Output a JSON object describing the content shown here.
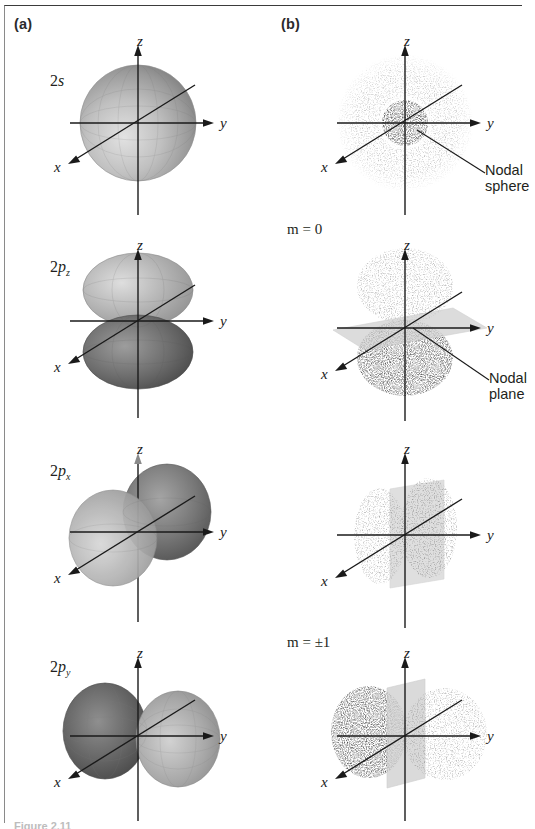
{
  "figure": {
    "columns": [
      {
        "key": "a",
        "letter": "(a)",
        "description": "boundary surface representations"
      },
      {
        "key": "b",
        "letter": "(b)",
        "description": "electron density dot cloud representations"
      }
    ],
    "caption_fragment": "Figure 2.11"
  },
  "axes": {
    "z": "z",
    "y": "y",
    "x": "x"
  },
  "rows": [
    {
      "orbital_prefix": "2",
      "orbital_symbol": "s",
      "orbital_subscript": "",
      "orbital_label_text": "2s",
      "m_label": "",
      "callout": ""
    },
    {
      "orbital_prefix": "2",
      "orbital_symbol": "p",
      "orbital_subscript": "z",
      "orbital_label_text": "2pz",
      "m_label": "m = 0",
      "callout": "Nodal\nplane"
    },
    {
      "orbital_prefix": "2",
      "orbital_symbol": "p",
      "orbital_subscript": "x",
      "orbital_label_text": "2px",
      "m_label": "",
      "callout": ""
    },
    {
      "orbital_prefix": "2",
      "orbital_symbol": "p",
      "orbital_subscript": "y",
      "orbital_label_text": "2py",
      "m_label": "m = ±1",
      "callout": ""
    }
  ],
  "callouts": {
    "nodal_sphere": "Nodal\nsphere",
    "nodal_plane": "Nodal\nplane"
  },
  "colors": {
    "ink": "#231f20",
    "axis": "#1a1a1a",
    "frame": "#3b3b3b",
    "surface_light": "#d8d8d8",
    "surface_mid": "#a8a8a8",
    "surface_dark": "#5a5a5a",
    "dots_light": "#8d8d8d",
    "dots_dark": "#2e2e2e",
    "plane": "#cfcfcf"
  }
}
